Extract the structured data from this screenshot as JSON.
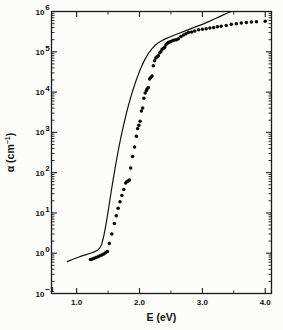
{
  "figure": {
    "background_color": "#fcfcfb",
    "foreground_color": "#111111"
  },
  "chart_data": {
    "type": "scatter",
    "title": "",
    "subtitle": "",
    "xlabel": "E (eV)",
    "ylabel": "α (cm⁻¹)",
    "ylabel_parts": {
      "symbol": "α",
      "unit_base": " (cm",
      "unit_exp": "−1",
      "unit_close": ")"
    },
    "xlim": [
      0.6,
      4.1
    ],
    "ylim": [
      0.1,
      1000000
    ],
    "yscale": "log",
    "xscale": "linear",
    "grid": false,
    "legend": null,
    "x_ticks_major": [
      1.0,
      2.0,
      3.0,
      4.0
    ],
    "x_tick_labels": [
      "1.0",
      "2.0",
      "3.0",
      "4.0"
    ],
    "x_ticks_minor": [
      1.5,
      2.5,
      3.5
    ],
    "y_ticks_major": [
      0.1,
      1,
      10,
      100,
      1000,
      10000,
      100000,
      1000000
    ],
    "y_tick_labels": [
      {
        "mantissa": "10",
        "exponent": "−1"
      },
      {
        "mantissa": "10",
        "exponent": "0"
      },
      {
        "mantissa": "10",
        "exponent": "1"
      },
      {
        "mantissa": "10",
        "exponent": "2"
      },
      {
        "mantissa": "10",
        "exponent": "3"
      },
      {
        "mantissa": "10",
        "exponent": "4"
      },
      {
        "mantissa": "10",
        "exponent": "5"
      },
      {
        "mantissa": "10",
        "exponent": "6"
      }
    ],
    "series": [
      {
        "name": "measured",
        "type": "scatter",
        "marker": "filled-circle",
        "marker_size_px": 3.5,
        "color": "#080808",
        "points": [
          [
            1.22,
            0.7
          ],
          [
            1.25,
            0.72
          ],
          [
            1.28,
            0.75
          ],
          [
            1.31,
            0.78
          ],
          [
            1.34,
            0.82
          ],
          [
            1.37,
            0.86
          ],
          [
            1.4,
            0.9
          ],
          [
            1.43,
            0.95
          ],
          [
            1.46,
            1.02
          ],
          [
            1.49,
            1.1
          ],
          [
            1.52,
            1.75
          ],
          [
            1.56,
            3.0
          ],
          [
            1.6,
            5.5
          ],
          [
            1.63,
            8.5
          ],
          [
            1.66,
            13.0
          ],
          [
            1.69,
            19.0
          ],
          [
            1.72,
            27.0
          ],
          [
            1.75,
            38.0
          ],
          [
            1.78,
            55.0
          ],
          [
            1.8,
            60.0
          ],
          [
            1.82,
            62.0
          ],
          [
            1.84,
            66.0
          ],
          [
            1.86,
            130.0
          ],
          [
            1.89,
            250.0
          ],
          [
            1.92,
            430.0
          ],
          [
            1.95,
            800.0
          ],
          [
            1.97,
            1250.0
          ],
          [
            1.99,
            1500.0
          ],
          [
            2.01,
            1900.0
          ],
          [
            2.03,
            3400.0
          ],
          [
            2.05,
            4000.0
          ],
          [
            2.07,
            7000.0
          ],
          [
            2.09,
            9500.0
          ],
          [
            2.11,
            11000.0
          ],
          [
            2.12,
            12000.0
          ],
          [
            2.14,
            13000.0
          ],
          [
            2.16,
            21000.0
          ],
          [
            2.18,
            23000.0
          ],
          [
            2.2,
            25000.0
          ],
          [
            2.22,
            45000.0
          ],
          [
            2.24,
            60000.0
          ],
          [
            2.26,
            70000.0
          ],
          [
            2.28,
            75000.0
          ],
          [
            2.3,
            80000.0
          ],
          [
            2.32,
            95000.0
          ],
          [
            2.34,
            100000.0
          ],
          [
            2.36,
            115000.0
          ],
          [
            2.38,
            120000.0
          ],
          [
            2.4,
            130000.0
          ],
          [
            2.42,
            150000.0
          ],
          [
            2.44,
            160000.0
          ],
          [
            2.46,
            170000.0
          ],
          [
            2.48,
            175000.0
          ],
          [
            2.5,
            180000.0
          ],
          [
            2.53,
            190000.0
          ],
          [
            2.56,
            195000.0
          ],
          [
            2.59,
            200000.0
          ],
          [
            2.62,
            210000.0
          ],
          [
            2.66,
            240000.0
          ],
          [
            2.7,
            260000.0
          ],
          [
            2.74,
            280000.0
          ],
          [
            2.78,
            300000.0
          ],
          [
            2.83,
            310000.0
          ],
          [
            2.88,
            330000.0
          ],
          [
            2.94,
            350000.0
          ],
          [
            3.0,
            360000.0
          ],
          [
            3.06,
            375000.0
          ],
          [
            3.12,
            390000.0
          ],
          [
            3.18,
            400000.0
          ],
          [
            3.24,
            420000.0
          ],
          [
            3.3,
            430000.0
          ],
          [
            3.38,
            450000.0
          ],
          [
            3.46,
            480000.0
          ],
          [
            3.54,
            500000.0
          ],
          [
            3.62,
            520000.0
          ],
          [
            3.7,
            530000.0
          ],
          [
            3.78,
            545000.0
          ],
          [
            3.86,
            555000.0
          ],
          [
            4.0,
            570000.0
          ]
        ]
      },
      {
        "name": "calculated",
        "type": "line",
        "color": "#111111",
        "points": [
          [
            0.85,
            0.62
          ],
          [
            0.95,
            0.72
          ],
          [
            1.05,
            0.82
          ],
          [
            1.15,
            0.92
          ],
          [
            1.22,
            1.0
          ],
          [
            1.28,
            1.08
          ],
          [
            1.33,
            1.18
          ],
          [
            1.37,
            1.35
          ],
          [
            1.4,
            1.7
          ],
          [
            1.43,
            2.6
          ],
          [
            1.46,
            4.5
          ],
          [
            1.49,
            8.5
          ],
          [
            1.52,
            17.0
          ],
          [
            1.55,
            34.0
          ],
          [
            1.58,
            66.0
          ],
          [
            1.61,
            125.0
          ],
          [
            1.64,
            230.0
          ],
          [
            1.67,
            410.0
          ],
          [
            1.7,
            700.0
          ],
          [
            1.73,
            1150.0
          ],
          [
            1.76,
            1850.0
          ],
          [
            1.79,
            2900.0
          ],
          [
            1.82,
            4400.0
          ],
          [
            1.85,
            6500.0
          ],
          [
            1.88,
            9400.0
          ],
          [
            1.91,
            13200.0
          ],
          [
            1.94,
            18200.0
          ],
          [
            1.97,
            24500.0
          ],
          [
            2.0,
            32500.0
          ],
          [
            2.04,
            46000.0
          ],
          [
            2.08,
            62000.0
          ],
          [
            2.12,
            80000.0
          ],
          [
            2.16,
            100000.0
          ],
          [
            2.2,
            120000.0
          ],
          [
            2.25,
            145000.0
          ],
          [
            2.3,
            168000.0
          ],
          [
            2.36,
            190000.0
          ],
          [
            2.42,
            212000.0
          ],
          [
            2.5,
            240000.0
          ],
          [
            2.58,
            268000.0
          ],
          [
            2.66,
            300000.0
          ],
          [
            2.74,
            335000.0
          ],
          [
            2.82,
            375000.0
          ],
          [
            2.9,
            420000.0
          ],
          [
            3.0,
            480000.0
          ],
          [
            3.1,
            560000.0
          ],
          [
            3.2,
            660000.0
          ],
          [
            3.3,
            780000.0
          ],
          [
            3.4,
            920000.0
          ],
          [
            3.46,
            1000000.0
          ]
        ]
      }
    ]
  }
}
